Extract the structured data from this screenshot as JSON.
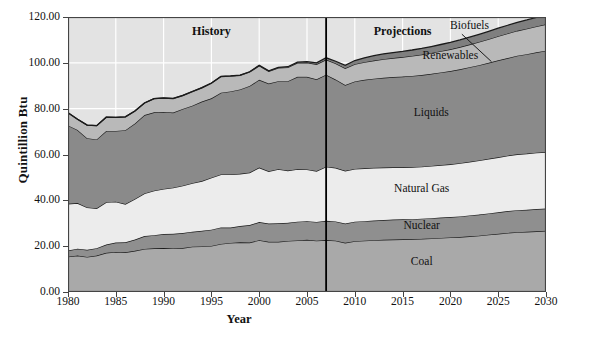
{
  "chart_data": {
    "type": "area",
    "title": "",
    "xlabel": "Year",
    "ylabel": "Quintillion Btu",
    "xlim": [
      1980,
      2030
    ],
    "ylim": [
      0,
      120
    ],
    "xticks": [
      1980,
      1985,
      1990,
      1995,
      2000,
      2005,
      2010,
      2015,
      2020,
      2025,
      2030
    ],
    "yticks": [
      "0.00",
      "20.00",
      "40.00",
      "60.00",
      "80.00",
      "100.00",
      "120.00"
    ],
    "grid": true,
    "grid_color": "#ffffff",
    "plot_background": "#e3e3e3",
    "stacked": true,
    "legend_position": "inline-labels",
    "x": [
      1980,
      1981,
      1982,
      1983,
      1984,
      1985,
      1986,
      1987,
      1988,
      1989,
      1990,
      1991,
      1992,
      1993,
      1994,
      1995,
      1996,
      1997,
      1998,
      1999,
      2000,
      2001,
      2002,
      2003,
      2004,
      2005,
      2006,
      2007,
      2008,
      2009,
      2010,
      2011,
      2012,
      2013,
      2014,
      2015,
      2016,
      2017,
      2018,
      2019,
      2020,
      2021,
      2022,
      2023,
      2024,
      2025,
      2026,
      2027,
      2028,
      2029,
      2030
    ],
    "series": [
      {
        "name": "Coal",
        "color": "#a9a9a9",
        "values": [
          15.4,
          15.9,
          15.3,
          15.9,
          17.1,
          17.5,
          17.3,
          18.0,
          18.8,
          19.1,
          19.2,
          19.0,
          19.2,
          19.8,
          19.9,
          20.1,
          21.0,
          21.4,
          21.7,
          21.6,
          22.6,
          21.9,
          21.9,
          22.3,
          22.5,
          22.8,
          22.4,
          22.7,
          22.4,
          21.5,
          22.2,
          22.4,
          22.6,
          22.8,
          22.9,
          23.0,
          23.1,
          23.2,
          23.4,
          23.6,
          23.8,
          24.0,
          24.3,
          24.6,
          25.0,
          25.4,
          25.8,
          26.1,
          26.3,
          26.5,
          26.7
        ]
      },
      {
        "name": "Nuclear",
        "color": "#8f8f8f",
        "values": [
          2.7,
          3.0,
          3.1,
          3.2,
          3.6,
          4.1,
          4.4,
          4.9,
          5.6,
          5.7,
          6.1,
          6.4,
          6.5,
          6.5,
          6.8,
          7.1,
          7.2,
          6.7,
          7.1,
          7.6,
          7.9,
          8.0,
          8.1,
          7.9,
          8.2,
          8.1,
          8.2,
          8.4,
          8.4,
          8.4,
          8.5,
          8.5,
          8.6,
          8.6,
          8.7,
          8.7,
          8.7,
          8.8,
          8.8,
          8.9,
          8.9,
          9.0,
          9.1,
          9.2,
          9.3,
          9.4,
          9.5,
          9.6,
          9.6,
          9.7,
          9.7
        ]
      },
      {
        "name": "Natural Gas",
        "color": "#ececec",
        "values": [
          20.4,
          19.9,
          18.5,
          17.4,
          18.5,
          17.8,
          16.7,
          17.7,
          18.6,
          19.4,
          19.7,
          20.1,
          20.7,
          21.2,
          21.7,
          22.7,
          23.1,
          23.2,
          22.8,
          22.9,
          23.8,
          22.8,
          23.6,
          22.8,
          22.9,
          22.6,
          22.2,
          23.6,
          23.4,
          23.0,
          23.0,
          23.1,
          23.0,
          22.9,
          22.8,
          22.7,
          22.7,
          22.7,
          22.8,
          22.9,
          23.0,
          23.2,
          23.4,
          23.6,
          23.8,
          24.0,
          24.2,
          24.4,
          24.5,
          24.6,
          24.7
        ]
      },
      {
        "name": "Liquids",
        "color": "#8a8a8a",
        "values": [
          34.2,
          31.9,
          30.2,
          30.1,
          31.1,
          30.9,
          32.2,
          32.9,
          34.2,
          34.2,
          33.6,
          32.8,
          33.5,
          33.8,
          34.7,
          34.6,
          35.7,
          36.2,
          36.8,
          37.8,
          38.3,
          38.3,
          38.4,
          39.0,
          40.3,
          40.4,
          40.0,
          40.1,
          38.5,
          37.4,
          38.2,
          38.6,
          38.9,
          39.2,
          39.4,
          39.6,
          39.8,
          40.0,
          40.2,
          40.4,
          40.7,
          41.0,
          41.3,
          41.6,
          41.9,
          42.3,
          42.6,
          43.0,
          43.4,
          43.8,
          44.2
        ]
      },
      {
        "name": "Renewables",
        "color": "#b9b9b9",
        "values": [
          5.5,
          4.7,
          5.7,
          6.0,
          6.0,
          5.9,
          5.8,
          5.5,
          5.3,
          6.0,
          6.0,
          6.1,
          5.8,
          6.1,
          6.0,
          6.6,
          7.0,
          6.7,
          6.1,
          6.1,
          6.1,
          5.3,
          5.8,
          6.0,
          6.1,
          6.2,
          6.6,
          6.6,
          7.0,
          7.3,
          7.5,
          7.7,
          7.9,
          8.1,
          8.3,
          8.5,
          8.7,
          8.9,
          9.1,
          9.3,
          9.5,
          9.7,
          9.9,
          10.1,
          10.3,
          10.5,
          10.7,
          10.9,
          11.1,
          11.3,
          11.5
        ]
      },
      {
        "name": "Biofuels",
        "color": "#7f7f7f",
        "values": [
          0.0,
          0.0,
          0.0,
          0.0,
          0.0,
          0.0,
          0.0,
          0.0,
          0.0,
          0.0,
          0.1,
          0.1,
          0.1,
          0.1,
          0.1,
          0.1,
          0.1,
          0.1,
          0.1,
          0.1,
          0.2,
          0.2,
          0.2,
          0.3,
          0.3,
          0.4,
          0.6,
          0.8,
          1.0,
          1.3,
          1.6,
          1.9,
          2.1,
          2.3,
          2.4,
          2.5,
          2.6,
          2.7,
          2.8,
          2.9,
          3.0,
          3.1,
          3.2,
          3.3,
          3.4,
          3.5,
          3.6,
          3.7,
          3.8,
          3.9,
          4.0
        ]
      }
    ],
    "annotations": [
      {
        "text": "History",
        "x": 1995,
        "y": 114
      },
      {
        "text": "Projections",
        "x": 2015,
        "y": 114
      },
      {
        "text": "Biofuels",
        "x": 2022,
        "y": 116
      },
      {
        "text": "Renewables",
        "x": 2020,
        "y": 103
      },
      {
        "text": "Liquids",
        "x": 2018,
        "y": 78
      },
      {
        "text": "Natural Gas",
        "x": 2017,
        "y": 45
      },
      {
        "text": "Nuclear",
        "x": 2017,
        "y": 29
      },
      {
        "text": "Coal",
        "x": 2017,
        "y": 13
      }
    ],
    "divider": {
      "x": 2007,
      "label": "history-projection-divider"
    }
  },
  "credit": {
    "text": "Data are from the Energy Information Administration's Annual Energy Outlook, 2009"
  }
}
